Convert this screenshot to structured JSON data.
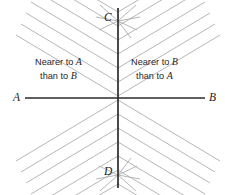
{
  "figure": {
    "endpoint_labels": {
      "left": "A",
      "right": "B",
      "top": "C",
      "bottom": "D"
    },
    "regions": [
      {
        "name": "left-half-plane",
        "line1": "Nearer to ",
        "line1_point": "A",
        "line2": "than to ",
        "line2_point": "B"
      },
      {
        "name": "right-half-plane",
        "line1": "Nearer to ",
        "line1_point": "B",
        "line2": "than to ",
        "line2_point": "A"
      }
    ],
    "colors": {
      "background": "#ffffff",
      "axis": "#2b2b2b",
      "hatch": "#a8a8a8",
      "text": "#262626"
    },
    "geometry": {
      "origin_x": 118,
      "origin_y": 98,
      "horizontal_axis": {
        "x1": 25,
        "x2": 205,
        "y": 98
      },
      "vertical_axis": {
        "x": 118,
        "y1": 8,
        "y2": 188
      },
      "hatch_slope_deg": 31,
      "hatch_spacing_px": 14.4,
      "hatch_line_count_per_side": 12
    }
  }
}
